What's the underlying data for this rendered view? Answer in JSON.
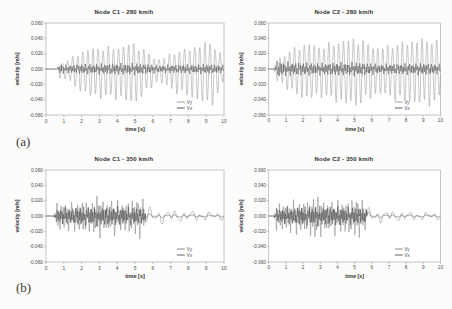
{
  "figure": {
    "label_a": "(a)",
    "label_b": "(b)"
  },
  "colors": {
    "plot_border": "#9e9e9e",
    "tick_text": "#4a4a4a",
    "axis_label_text": "#2e2e2e",
    "vy_line": "#848484",
    "vx_line": "#353535",
    "page_background": "#fcfcfa"
  },
  "chart_data": [
    {
      "type": "line",
      "title": "Node C1 - 280 km/h",
      "xlabel": "time [s]",
      "ylabel": "velocity [m/s]",
      "xlim": [
        0,
        10
      ],
      "ylim": [
        -0.06,
        0.06
      ],
      "xtick_labels": [
        "0",
        "1",
        "2",
        "3",
        "4",
        "5",
        "6",
        "7",
        "8",
        "9",
        "10"
      ],
      "ytick_labels": [
        "0.060",
        "0.040",
        "0.020",
        "0.000",
        "-0.020",
        "-0.040",
        "-0.060"
      ],
      "grid": false,
      "legend_position": "inside-bottom-right",
      "series": [
        {
          "name": "Vy",
          "color": "#848484",
          "freq": 3.5,
          "neg_gain": 1.35,
          "jitter": 0.12,
          "envelope": [
            [
              0,
              0
            ],
            [
              0.62,
              0
            ],
            [
              0.75,
              0.01
            ],
            [
              1.0,
              0.008
            ],
            [
              1.3,
              0.013
            ],
            [
              1.8,
              0.02
            ],
            [
              2.5,
              0.027
            ],
            [
              3.5,
              0.028
            ],
            [
              4.3,
              0.029
            ],
            [
              4.8,
              0.035
            ],
            [
              5.3,
              0.028
            ],
            [
              6.3,
              0.012
            ],
            [
              7.2,
              0.022
            ],
            [
              8.2,
              0.028
            ],
            [
              9.2,
              0.036
            ],
            [
              9.6,
              0.028
            ],
            [
              9.9,
              0.015
            ],
            [
              10,
              0.012
            ]
          ]
        },
        {
          "name": "Vx",
          "color": "#353535",
          "freq": 11,
          "neg_gain": 1.0,
          "jitter": 1,
          "envelope": [
            [
              0,
              0
            ],
            [
              0.62,
              0
            ],
            [
              0.8,
              0.006
            ],
            [
              1.1,
              0.004
            ],
            [
              2,
              0.005
            ],
            [
              5,
              0.006
            ],
            [
              6.3,
              0.004
            ],
            [
              9,
              0.005
            ],
            [
              10,
              0.004
            ]
          ]
        }
      ]
    },
    {
      "type": "line",
      "title": "Node C2 - 280 km/h",
      "xlabel": "time [s]",
      "ylabel": "velocity [m/s]",
      "xlim": [
        0,
        10
      ],
      "ylim": [
        -0.06,
        0.06
      ],
      "xtick_labels": [
        "0",
        "1",
        "2",
        "3",
        "4",
        "5",
        "6",
        "7",
        "8",
        "9",
        "10"
      ],
      "ytick_labels": [
        "0.060",
        "0.040",
        "0.020",
        "0.000",
        "-0.020",
        "-0.040",
        "-0.060"
      ],
      "grid": false,
      "legend_position": "inside-bottom-right",
      "series": [
        {
          "name": "Vy",
          "color": "#848484",
          "freq": 3.5,
          "neg_gain": 1.2,
          "jitter": 0.12,
          "envelope": [
            [
              0,
              0
            ],
            [
              0.3,
              0
            ],
            [
              0.45,
              0.013
            ],
            [
              0.8,
              0.016
            ],
            [
              1.2,
              0.024
            ],
            [
              1.8,
              0.03
            ],
            [
              2.3,
              0.034
            ],
            [
              2.9,
              0.029
            ],
            [
              3.6,
              0.033
            ],
            [
              4.4,
              0.038
            ],
            [
              5.1,
              0.04
            ],
            [
              5.8,
              0.033
            ],
            [
              6.4,
              0.027
            ],
            [
              7.2,
              0.032
            ],
            [
              8.1,
              0.036
            ],
            [
              9.0,
              0.039
            ],
            [
              9.7,
              0.038
            ],
            [
              10,
              0.03
            ]
          ]
        },
        {
          "name": "Vx",
          "color": "#353535",
          "freq": 11,
          "neg_gain": 1.0,
          "jitter": 1,
          "envelope": [
            [
              0,
              0
            ],
            [
              0.3,
              0
            ],
            [
              0.5,
              0.009
            ],
            [
              1,
              0.007
            ],
            [
              3,
              0.006
            ],
            [
              5,
              0.007
            ],
            [
              6.5,
              0.005
            ],
            [
              9,
              0.006
            ],
            [
              10,
              0.005
            ]
          ]
        }
      ]
    },
    {
      "type": "line",
      "title": "Node C1 - 350 km/h",
      "xlabel": "time [s]",
      "ylabel": "velocity [m/s]",
      "xlim": [
        0,
        10
      ],
      "ylim": [
        -0.06,
        0.06
      ],
      "xtick_labels": [
        "0",
        "1",
        "2",
        "3",
        "4",
        "5",
        "6",
        "7",
        "8",
        "9",
        "10"
      ],
      "ytick_labels": [
        "0.060",
        "0.040",
        "0.020",
        "0.000",
        "-0.020",
        "-0.040",
        "-0.060"
      ],
      "grid": false,
      "legend_position": "inside-bottom-right",
      "series": [
        {
          "name": "Vy",
          "color": "#6e6e6e",
          "freq": 8.5,
          "freq_tail": 2.1,
          "t_switch": 5.6,
          "neg_gain": 1.15,
          "jitter": 0.9,
          "envelope": [
            [
              0,
              0
            ],
            [
              0.45,
              0
            ],
            [
              0.55,
              0.013
            ],
            [
              1,
              0.015
            ],
            [
              1.5,
              0.013
            ],
            [
              2,
              0.016
            ],
            [
              2.5,
              0.014
            ],
            [
              2.9,
              0.021
            ],
            [
              3.3,
              0.015
            ],
            [
              3.8,
              0.017
            ],
            [
              4.3,
              0.014
            ],
            [
              4.8,
              0.016
            ],
            [
              5.3,
              0.021
            ],
            [
              5.55,
              0.014
            ],
            [
              5.7,
              0.009
            ],
            [
              6.5,
              0.007
            ],
            [
              7.5,
              0.006
            ],
            [
              8.5,
              0.005
            ],
            [
              10,
              0.004
            ]
          ]
        },
        {
          "name": "Vx",
          "color": "#353535",
          "freq": 11.5,
          "freq_tail": 2.1,
          "t_switch": 5.6,
          "neg_gain": 1.0,
          "jitter": 1,
          "envelope": [
            [
              0,
              0
            ],
            [
              0.45,
              0
            ],
            [
              0.6,
              0.008
            ],
            [
              3,
              0.01
            ],
            [
              5.5,
              0.008
            ],
            [
              5.8,
              0.002
            ],
            [
              7,
              0.0015
            ],
            [
              10,
              0.001
            ]
          ]
        }
      ]
    },
    {
      "type": "line",
      "title": "Node C2 - 350 km/h",
      "xlabel": "time [s]",
      "ylabel": "velocity [m/s]",
      "xlim": [
        0,
        10
      ],
      "ylim": [
        -0.06,
        0.06
      ],
      "xtick_labels": [
        "0",
        "1",
        "2",
        "3",
        "4",
        "5",
        "6",
        "7",
        "8",
        "9",
        "10"
      ],
      "ytick_labels": [
        "0.060",
        "0.040",
        "0.020",
        "0.000",
        "-0.020",
        "-0.040",
        "-0.060"
      ],
      "grid": false,
      "legend_position": "inside-bottom-right",
      "series": [
        {
          "name": "Vy",
          "color": "#6e6e6e",
          "freq": 8.5,
          "freq_tail": 2.1,
          "t_switch": 5.7,
          "neg_gain": 1.2,
          "jitter": 0.9,
          "envelope": [
            [
              0,
              0
            ],
            [
              0.3,
              0
            ],
            [
              0.45,
              0.012
            ],
            [
              1,
              0.014
            ],
            [
              1.6,
              0.016
            ],
            [
              2.2,
              0.014
            ],
            [
              2.7,
              0.022
            ],
            [
              3.2,
              0.015
            ],
            [
              3.9,
              0.016
            ],
            [
              4.6,
              0.015
            ],
            [
              5.2,
              0.02
            ],
            [
              5.6,
              0.013
            ],
            [
              5.8,
              0.008
            ],
            [
              6.6,
              0.006
            ],
            [
              7.6,
              0.005
            ],
            [
              8.6,
              0.004
            ],
            [
              10,
              0.0035
            ]
          ]
        },
        {
          "name": "Vx",
          "color": "#353535",
          "freq": 11.5,
          "freq_tail": 2.1,
          "t_switch": 5.7,
          "neg_gain": 1.0,
          "jitter": 1,
          "envelope": [
            [
              0,
              0
            ],
            [
              0.3,
              0
            ],
            [
              0.45,
              0.008
            ],
            [
              3,
              0.01
            ],
            [
              5.6,
              0.008
            ],
            [
              5.9,
              0.002
            ],
            [
              7,
              0.0015
            ],
            [
              10,
              0.001
            ]
          ]
        }
      ]
    }
  ]
}
